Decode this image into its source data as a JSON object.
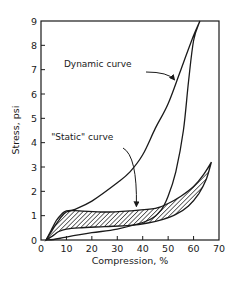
{
  "chart_data": {
    "type": "line",
    "title": "",
    "xlabel": "Compression, %",
    "ylabel": "Stress, psi",
    "xlim": [
      0,
      70
    ],
    "ylim": [
      0,
      9
    ],
    "xticks": [
      0,
      10,
      20,
      30,
      40,
      50,
      60,
      70
    ],
    "yticks": [
      0,
      1,
      2,
      3,
      4,
      5,
      6,
      7,
      8,
      9
    ],
    "grid": false,
    "legend": null,
    "series": [
      {
        "name": "Dynamic curve (loading)",
        "x": [
          2,
          5,
          8,
          10,
          13,
          20,
          30,
          35,
          40,
          45,
          50,
          55,
          60,
          62.5
        ],
        "y": [
          0,
          0.5,
          0.95,
          1.15,
          1.25,
          1.6,
          2.35,
          2.8,
          3.5,
          4.6,
          5.6,
          7.0,
          8.4,
          9.0
        ]
      },
      {
        "name": "Dynamic curve (unloading)",
        "x": [
          62.5,
          60,
          58,
          56,
          53,
          50,
          47,
          42,
          30,
          20,
          10,
          5,
          2
        ],
        "y": [
          9.0,
          8.2,
          6.5,
          4.5,
          2.8,
          1.8,
          1.2,
          0.8,
          0.45,
          0.3,
          0.12,
          0.02,
          0
        ]
      },
      {
        "name": "Static curve (loading)",
        "x": [
          2,
          4,
          6,
          8,
          10,
          15,
          25,
          35,
          45,
          50,
          55,
          60,
          64,
          67
        ],
        "y": [
          0,
          0.4,
          0.8,
          1.05,
          1.2,
          1.2,
          1.15,
          1.2,
          1.3,
          1.5,
          1.8,
          2.2,
          2.7,
          3.2
        ]
      },
      {
        "name": "Static curve (unloading)",
        "x": [
          67,
          65,
          62,
          58,
          53,
          48,
          42,
          35,
          25,
          15,
          10,
          7,
          5,
          2
        ],
        "y": [
          3.2,
          2.5,
          1.9,
          1.4,
          1.05,
          0.85,
          0.7,
          0.6,
          0.55,
          0.5,
          0.45,
          0.35,
          0.2,
          0
        ]
      }
    ],
    "annotations": [
      {
        "text": "Dynamic curve",
        "x_text": 9,
        "y_text": 7.1,
        "arrow_to": [
          52.5,
          6.5
        ]
      },
      {
        "text": "\"Static\" curve",
        "x_text": 4,
        "y_text": 4.1,
        "arrow_to": [
          37.5,
          1.3
        ]
      }
    ]
  },
  "labels": {
    "xlabel": "Compression, %",
    "ylabel": "Stress, psi",
    "dynamic": "Dynamic curve",
    "static": "\"Static\" curve"
  }
}
